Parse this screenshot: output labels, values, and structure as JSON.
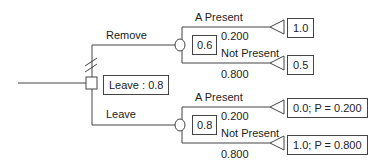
{
  "diagram": {
    "type": "decision-tree",
    "decision_node": {
      "label": "Leave : 0.8",
      "branches": [
        {
          "label": "Remove",
          "chance_node": {
            "value": "0.6",
            "outcomes": [
              {
                "label": "A Present",
                "probability": "0.200",
                "payoff": "1.0"
              },
              {
                "label": "Not Present",
                "probability": "0.800",
                "payoff": "0.5"
              }
            ]
          }
        },
        {
          "label": "Leave",
          "chance_node": {
            "value": "0.8",
            "outcomes": [
              {
                "label": "A Present",
                "probability": "0.200",
                "payoff": "0.0; P = 0.200"
              },
              {
                "label": "Not Present",
                "probability": "0.800",
                "payoff": "1.0; P = 0.800"
              }
            ]
          }
        }
      ]
    },
    "colors": {
      "line": "#444444",
      "text": "#222222",
      "background": "#ffffff"
    }
  }
}
